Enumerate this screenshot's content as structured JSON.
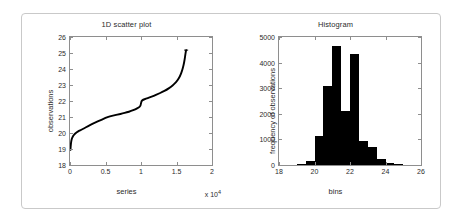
{
  "figure": {
    "background": "#ffffff",
    "border_color": "#c9c9c9",
    "axis_color": "#8e8e8e",
    "ink_color": "#000000"
  },
  "chart_data": [
    {
      "type": "line",
      "title": "1D scatter plot",
      "xlabel": "series",
      "ylabel": "observations",
      "x_exponent_label": "x 10",
      "x_exponent_power": "4",
      "xlim": [
        0,
        20000
      ],
      "ylim": [
        18,
        26
      ],
      "xticks": [
        0,
        5000,
        10000,
        15000,
        20000
      ],
      "xticklabels": [
        "0",
        "0.5",
        "1",
        "1.5",
        "2"
      ],
      "yticks": [
        18,
        19,
        20,
        21,
        22,
        23,
        24,
        25,
        26
      ],
      "yticklabels": [
        "18",
        "19",
        "20",
        "21",
        "22",
        "23",
        "24",
        "25",
        "26"
      ],
      "grid": false,
      "legend": null,
      "series_name": "sorted observations",
      "marker": "dot",
      "description": "Sorted values forming an S-curve with a step near x=1.0e4",
      "x": [
        60,
        120,
        200,
        320,
        480,
        700,
        950,
        1250,
        1600,
        2000,
        2500,
        3000,
        3600,
        4200,
        4800,
        5200,
        5600,
        6200,
        6800,
        7400,
        8000,
        8600,
        9200,
        9700,
        9950,
        10050,
        10300,
        10700,
        11200,
        11800,
        12400,
        13000,
        13600,
        14200,
        14700,
        15100,
        15500,
        15800,
        16000,
        16150,
        16250,
        16320,
        16360
      ],
      "y": [
        18.95,
        19.3,
        19.55,
        19.72,
        19.85,
        19.96,
        20.05,
        20.13,
        20.2,
        20.3,
        20.42,
        20.53,
        20.66,
        20.78,
        20.9,
        20.98,
        21.04,
        21.1,
        21.16,
        21.22,
        21.29,
        21.37,
        21.48,
        21.6,
        21.7,
        22.0,
        22.08,
        22.14,
        22.22,
        22.32,
        22.44,
        22.56,
        22.7,
        22.88,
        23.06,
        23.26,
        23.55,
        23.9,
        24.25,
        24.6,
        24.92,
        25.1,
        25.18
      ]
    },
    {
      "type": "bar",
      "title": "Histogram",
      "xlabel": "bins",
      "ylabel": "frequency of observations",
      "xlim": [
        18,
        26
      ],
      "ylim": [
        0,
        5000
      ],
      "xticks": [
        18,
        20,
        22,
        24,
        26
      ],
      "xticklabels": [
        "18",
        "20",
        "22",
        "24",
        "26"
      ],
      "yticks": [
        0,
        1000,
        2000,
        3000,
        4000,
        5000
      ],
      "yticklabels": [
        "0",
        "1000",
        "2000",
        "3000",
        "4000",
        "5000"
      ],
      "grid": false,
      "legend": null,
      "bar_color": "#000000",
      "bin_edges": [
        18.5,
        19.0,
        19.5,
        20.0,
        20.5,
        21.0,
        21.5,
        22.0,
        22.5,
        23.0,
        23.5,
        24.0,
        24.5,
        25.0,
        25.5
      ],
      "bin_centers": [
        18.75,
        19.25,
        19.75,
        20.25,
        20.75,
        21.25,
        21.75,
        22.25,
        22.75,
        23.25,
        23.75,
        24.25,
        24.75,
        25.25
      ],
      "values": [
        10,
        40,
        150,
        1150,
        3080,
        4650,
        2100,
        4320,
        950,
        700,
        230,
        60,
        20,
        10
      ]
    }
  ]
}
